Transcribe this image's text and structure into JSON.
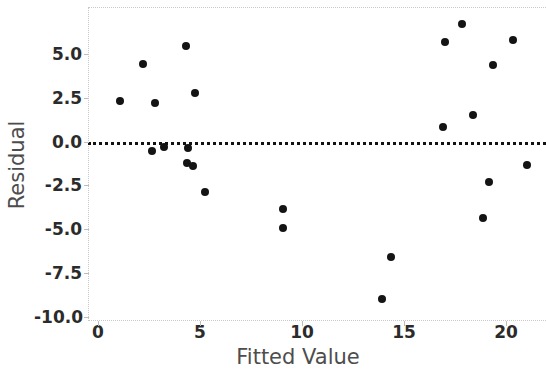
{
  "chart_data": {
    "type": "scatter",
    "title": "",
    "xlabel": "Fitted Value",
    "ylabel": "Residual",
    "xlim": [
      -0.5,
      22.0
    ],
    "ylim": [
      -10.9,
      7.7
    ],
    "xticks": [
      "0",
      "5",
      "10",
      "15",
      "20"
    ],
    "xtick_values": [
      0,
      5,
      10,
      15,
      20
    ],
    "yticks": [
      "5.0",
      "2.5",
      "0.0",
      "-2.5",
      "-5.0",
      "-7.5",
      "-10.0"
    ],
    "ytick_values": [
      5.0,
      2.5,
      0.0,
      -2.5,
      -5.0,
      -7.5,
      -10.0
    ],
    "grid": false,
    "legend": null,
    "reference_line": {
      "orientation": "horizontal",
      "y": 0.0,
      "style": "dotted",
      "color": "#111111"
    },
    "marker": {
      "shape": "circle",
      "color": "#141414",
      "size": 8
    },
    "frame_color": "#c8c8c8",
    "points": [
      {
        "x": 1.1,
        "y": 2.3
      },
      {
        "x": 2.2,
        "y": 4.4
      },
      {
        "x": 2.65,
        "y": -0.55
      },
      {
        "x": 2.8,
        "y": 2.2
      },
      {
        "x": 3.25,
        "y": -0.3
      },
      {
        "x": 4.3,
        "y": 5.45
      },
      {
        "x": 4.4,
        "y": -0.35
      },
      {
        "x": 4.35,
        "y": -1.25
      },
      {
        "x": 4.65,
        "y": -1.4
      },
      {
        "x": 4.75,
        "y": 2.75
      },
      {
        "x": 5.25,
        "y": -2.9
      },
      {
        "x": 9.05,
        "y": -3.85
      },
      {
        "x": 9.05,
        "y": -4.95
      },
      {
        "x": 13.9,
        "y": -9.0
      },
      {
        "x": 14.35,
        "y": -6.6
      },
      {
        "x": 16.9,
        "y": 0.85
      },
      {
        "x": 17.0,
        "y": 5.7
      },
      {
        "x": 17.85,
        "y": 6.7
      },
      {
        "x": 18.4,
        "y": 1.5
      },
      {
        "x": 18.85,
        "y": -4.35
      },
      {
        "x": 19.15,
        "y": -2.3
      },
      {
        "x": 19.35,
        "y": 4.35
      },
      {
        "x": 20.35,
        "y": 5.8
      },
      {
        "x": 21.05,
        "y": -1.35
      }
    ]
  }
}
